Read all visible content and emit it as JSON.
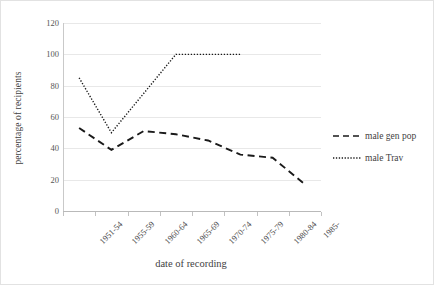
{
  "chart_data": {
    "type": "line",
    "title": "",
    "xlabel": "date of recording",
    "ylabel": "percentage of recipients",
    "categories": [
      "1951-54",
      "1955-59",
      "1960-64",
      "1965-69",
      "1970-74",
      "1975-79",
      "1980-84",
      "1985-"
    ],
    "ylim": [
      0,
      120
    ],
    "yticks": [
      0,
      20,
      40,
      60,
      80,
      100,
      120
    ],
    "grid": true,
    "legend_position": "right",
    "series": [
      {
        "name": "male gen pop",
        "style": "dashed",
        "color": "#1a1a1a",
        "values": [
          53,
          39,
          51,
          49,
          45,
          36,
          34,
          17
        ]
      },
      {
        "name": "male Trav",
        "style": "dotted",
        "color": "#1a1a1a",
        "values": [
          85,
          50,
          75,
          100,
          100,
          100,
          null,
          null
        ]
      }
    ]
  },
  "axes": {
    "y_title": "percentage of recipients",
    "x_title": "date of recording"
  },
  "legend": {
    "items": [
      {
        "label": "male gen pop",
        "icon": "dashed-line-icon"
      },
      {
        "label": "male Trav",
        "icon": "dotted-line-icon"
      }
    ]
  }
}
